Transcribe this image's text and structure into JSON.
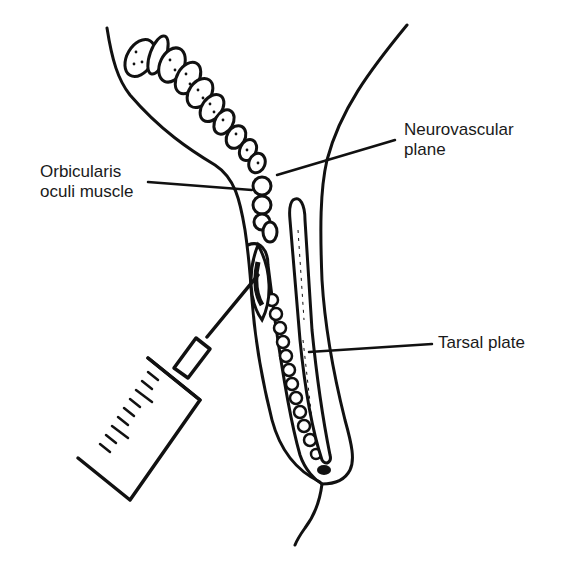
{
  "figure": {
    "type": "anatomical-line-drawing",
    "ink_color": "#111111",
    "background": "#ffffff"
  },
  "labels": {
    "neurovascular_line1": "Neurovascular",
    "neurovascular_line2": "plane",
    "orbicularis_line1": "Orbicularis",
    "orbicularis_line2": "oculi muscle",
    "tarsal": "Tarsal plate"
  }
}
